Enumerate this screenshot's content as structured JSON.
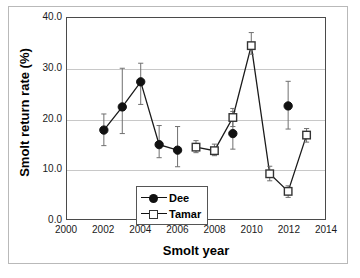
{
  "chart_data": {
    "type": "line",
    "title": "",
    "xlabel": "Smolt year",
    "ylabel": "Smolt return rate (%)",
    "xlim": [
      2000,
      2014
    ],
    "ylim": [
      0.0,
      40.0
    ],
    "xticks": [
      2000,
      2002,
      2004,
      2006,
      2008,
      2010,
      2012,
      2014
    ],
    "xticklabels": [
      "2000",
      "2002",
      "2004",
      "2006",
      "2008",
      "2010",
      "2012",
      "2014"
    ],
    "yticks": [
      0.0,
      10.0,
      20.0,
      30.0,
      40.0
    ],
    "yticklabels": [
      "0.0",
      "10.0",
      "20.0",
      "30.0",
      "40.0"
    ],
    "grid": "horizontal",
    "legend_position": "lower-left",
    "series": [
      {
        "name": "Dee",
        "marker": "filled-circle",
        "color": "#111111",
        "x": [
          2002,
          2003,
          2004,
          2005,
          2006,
          2009,
          2012
        ],
        "values": [
          17.7,
          22.3,
          27.3,
          14.8,
          13.7,
          17.0,
          22.5
        ],
        "err_low": [
          14.6,
          17.0,
          22.8,
          12.2,
          10.4,
          13.9,
          17.9
        ],
        "err_high": [
          20.9,
          30.0,
          31.0,
          18.6,
          18.4,
          21.4,
          27.4
        ],
        "connected_segments": [
          [
            2002,
            2003,
            2004,
            2005,
            2006
          ]
        ]
      },
      {
        "name": "Tamar",
        "marker": "open-square",
        "color": "#333333",
        "x": [
          2007,
          2008,
          2009,
          2010,
          2011,
          2012,
          2013
        ],
        "values": [
          14.3,
          13.6,
          20.2,
          34.5,
          9.0,
          5.5,
          16.7
        ],
        "err_low": [
          13.2,
          12.6,
          18.4,
          32.8,
          7.6,
          4.3,
          15.3
        ],
        "err_high": [
          15.6,
          14.9,
          22.0,
          37.1,
          10.5,
          6.6,
          18.0
        ],
        "connected_segments": [
          [
            2007,
            2008,
            2009,
            2010,
            2011,
            2012,
            2013
          ]
        ]
      }
    ]
  },
  "legend": {
    "items": [
      {
        "label": "Dee"
      },
      {
        "label": "Tamar"
      }
    ]
  }
}
